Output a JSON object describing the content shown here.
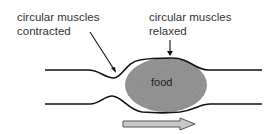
{
  "labels": {
    "contracted": {
      "line1": "circular muscles",
      "line2": "contracted"
    },
    "relaxed": {
      "line1": "circular muscles",
      "line2": "relaxed"
    },
    "food": "food"
  },
  "colors": {
    "outline": "#111111",
    "food_fill": "#9a9a9a",
    "arrow_fill": "#c8c8c8",
    "arrow_stroke": "#555555",
    "text": "#333333"
  },
  "arrow": {
    "direction": "right"
  }
}
